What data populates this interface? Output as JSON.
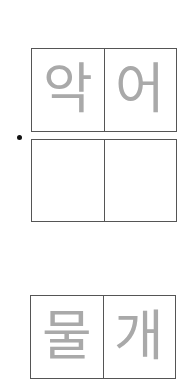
{
  "worksheet": {
    "rows": [
      {
        "cells": [
          "악",
          "어"
        ],
        "type": "trace"
      },
      {
        "cells": [
          "",
          ""
        ],
        "type": "blank",
        "bullet": true
      },
      {
        "cells": [
          "물",
          "개"
        ],
        "type": "trace"
      }
    ]
  },
  "colors": {
    "border": "#555555",
    "guide_text": "#a9a9a9",
    "bullet": "#111111"
  }
}
